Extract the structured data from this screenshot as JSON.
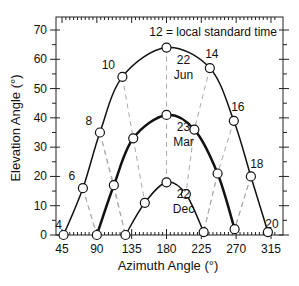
{
  "chart_data": {
    "type": "line",
    "title": "",
    "annotation": "12 = local standard time",
    "xlabel": "Azimuth Angle (°)",
    "ylabel": "Elevation Angle (°)",
    "xlim": [
      45,
      320
    ],
    "ylim": [
      0,
      70
    ],
    "xticks": [
      45,
      90,
      135,
      180,
      225,
      270,
      315
    ],
    "yticks": [
      0,
      10,
      20,
      30,
      40,
      50,
      60,
      70
    ],
    "grid": false,
    "series": [
      {
        "name": "22 Jun",
        "label_line1": "22",
        "label_line2": "Jun",
        "points": [
          {
            "hour": 4,
            "azimuth": 47,
            "elevation": 0
          },
          {
            "hour": 6,
            "azimuth": 72,
            "elevation": 16
          },
          {
            "hour": 8,
            "azimuth": 94,
            "elevation": 35
          },
          {
            "hour": 10,
            "azimuth": 123,
            "elevation": 54
          },
          {
            "hour": 12,
            "azimuth": 180,
            "elevation": 64
          },
          {
            "hour": 14,
            "azimuth": 236,
            "elevation": 57
          },
          {
            "hour": 16,
            "azimuth": 267,
            "elevation": 39
          },
          {
            "hour": 18,
            "azimuth": 289,
            "elevation": 20
          },
          {
            "hour": 20,
            "azimuth": 311,
            "elevation": 1
          }
        ]
      },
      {
        "name": "23 Mar",
        "label_line1": "23",
        "label_line2": "Mar",
        "points": [
          {
            "hour": 6,
            "azimuth": 90,
            "elevation": 0
          },
          {
            "hour": 8,
            "azimuth": 112,
            "elevation": 17
          },
          {
            "hour": 10,
            "azimuth": 137,
            "elevation": 33
          },
          {
            "hour": 12,
            "azimuth": 180,
            "elevation": 41
          },
          {
            "hour": 14,
            "azimuth": 216,
            "elevation": 36
          },
          {
            "hour": 16,
            "azimuth": 246,
            "elevation": 21
          },
          {
            "hour": 18,
            "azimuth": 268,
            "elevation": 2
          }
        ]
      },
      {
        "name": "22 Dec",
        "label_line1": "22",
        "label_line2": "Dec",
        "points": [
          {
            "hour": 8,
            "azimuth": 127,
            "elevation": 0
          },
          {
            "hour": 10,
            "azimuth": 152,
            "elevation": 11
          },
          {
            "hour": 12,
            "azimuth": 180,
            "elevation": 18
          },
          {
            "hour": 14,
            "azimuth": 205,
            "elevation": 14
          },
          {
            "hour": 16,
            "azimuth": 228,
            "elevation": 1
          }
        ]
      }
    ],
    "hour_labels": [
      {
        "text": "4",
        "series": "22 Jun"
      },
      {
        "text": "6",
        "series": "22 Jun"
      },
      {
        "text": "8",
        "series": "22 Jun"
      },
      {
        "text": "10",
        "series": "22 Jun"
      },
      {
        "text": "14",
        "series": "22 Jun"
      },
      {
        "text": "16",
        "series": "22 Jun"
      },
      {
        "text": "18",
        "series": "22 Jun"
      },
      {
        "text": "20",
        "series": "22 Jun"
      }
    ]
  }
}
